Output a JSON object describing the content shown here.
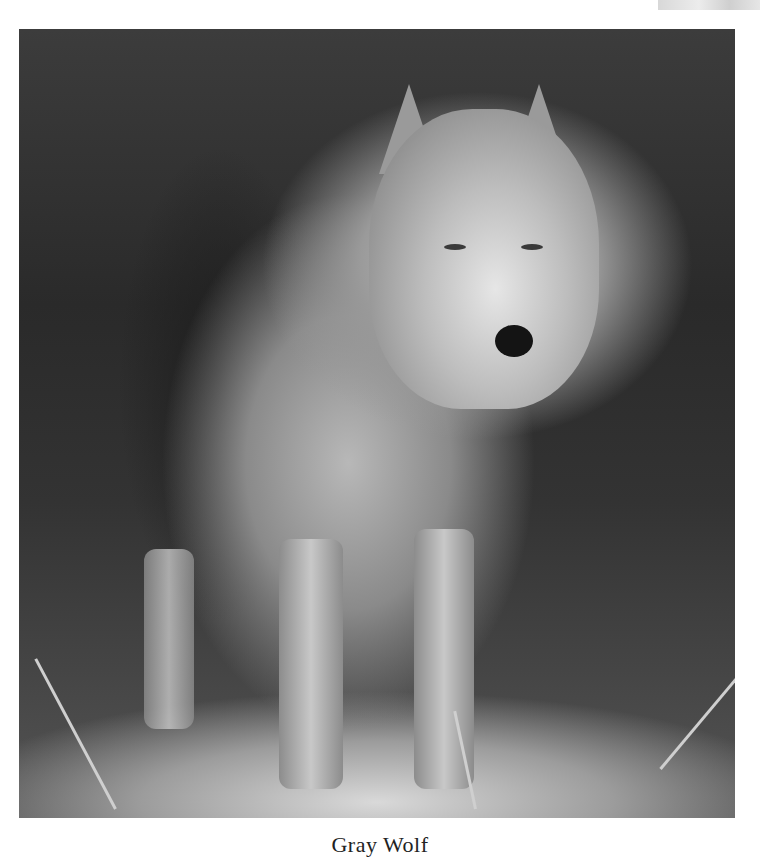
{
  "page": {
    "background": "#ffffff"
  },
  "photo": {
    "subject": "gray wolf standing in tall grass",
    "alt": "Photograph of a gray wolf standing in grass in front of dark brush",
    "tone": "grayscale"
  },
  "caption": {
    "text": "Gray Wolf"
  },
  "corner_thumbnail": {
    "description": "partially visible image at top-right edge"
  }
}
